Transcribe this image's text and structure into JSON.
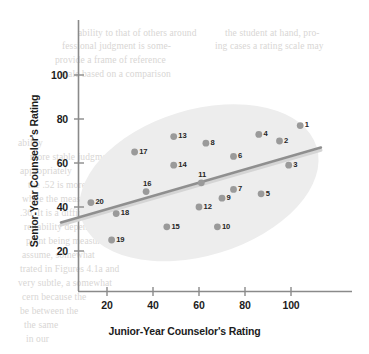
{
  "chart_data": {
    "type": "scatter",
    "title": "",
    "xlabel": "Junior-Year Counselor's Rating",
    "ylabel": "Senior-Year Counselor's Rating",
    "xlim": [
      0,
      118
    ],
    "ylim": [
      8,
      112
    ],
    "xticks": [
      20,
      40,
      60,
      80,
      100
    ],
    "yticks": [
      20,
      40,
      60,
      80,
      100
    ],
    "grid": false,
    "legend": null,
    "point_color": "#9a9a9a",
    "label_color": "#262626",
    "ellipse_color": "#ededed",
    "regression_line_color": "#8f8f8f",
    "axis_color": "#8a8a8a",
    "points": [
      {
        "label": "1",
        "x": 104,
        "y": 77
      },
      {
        "label": "2",
        "x": 95,
        "y": 70
      },
      {
        "label": "3",
        "x": 99,
        "y": 59
      },
      {
        "label": "4",
        "x": 86,
        "y": 73
      },
      {
        "label": "5",
        "x": 87,
        "y": 46
      },
      {
        "label": "6",
        "x": 75,
        "y": 63
      },
      {
        "label": "7",
        "x": 75,
        "y": 48
      },
      {
        "label": "8",
        "x": 63,
        "y": 69
      },
      {
        "label": "9",
        "x": 70,
        "y": 44
      },
      {
        "label": "10",
        "x": 68,
        "y": 31
      },
      {
        "label": "11",
        "x": 61,
        "y": 51
      },
      {
        "label": "12",
        "x": 60,
        "y": 40
      },
      {
        "label": "13",
        "x": 49,
        "y": 72
      },
      {
        "label": "14",
        "x": 49,
        "y": 59
      },
      {
        "label": "15",
        "x": 46,
        "y": 31
      },
      {
        "label": "16",
        "x": 37,
        "y": 47
      },
      {
        "label": "17",
        "x": 32,
        "y": 65
      },
      {
        "label": "18",
        "x": 24,
        "y": 37
      },
      {
        "label": "19",
        "x": 22,
        "y": 25
      },
      {
        "label": "20",
        "x": 13,
        "y": 42
      }
    ],
    "regression_line": {
      "x_start": 0,
      "y_start": 33,
      "x_end": 113,
      "y_end": 67
    },
    "ellipse": {
      "center_x": 60,
      "center_y": 51,
      "angle_deg": -17
    },
    "annotations": []
  },
  "page_bleed": {
    "lines": [
      {
        "text": "ability to that of others around",
        "x": 78,
        "y": 28
      },
      {
        "text": "the student at hand, pro-",
        "x": 225,
        "y": 28
      },
      {
        "text": "fessional judgment is some-",
        "x": 62,
        "y": 41
      },
      {
        "text": "ing cases a rating scale may",
        "x": 215,
        "y": 41
      },
      {
        "text": "provide a frame of reference",
        "x": 55,
        "y": 55
      },
      {
        "text": "scale based on a comparison",
        "x": 60,
        "y": 69
      },
      {
        "text": "ability",
        "x": 18,
        "y": 138
      },
      {
        "text": "more stable judgment will",
        "x": 30,
        "y": 152
      },
      {
        "text": "appropriately",
        "x": 20,
        "y": 166
      },
      {
        "text": "the .52 is more typical",
        "x": 28,
        "y": 180
      },
      {
        "text": "while the measure",
        "x": 22,
        "y": 194
      },
      {
        "text": ".36. It is a difficult problem",
        "x": 20,
        "y": 208
      },
      {
        "text": "reliability depends on",
        "x": 24,
        "y": 222
      },
      {
        "text": "point being measured",
        "x": 26,
        "y": 236
      },
      {
        "text": "assume, somewhat",
        "x": 22,
        "y": 250
      },
      {
        "text": "trated in Figures 4.1a and",
        "x": 20,
        "y": 264
      },
      {
        "text": "very subtle, a somewhat",
        "x": 18,
        "y": 278
      },
      {
        "text": "cern because the",
        "x": 22,
        "y": 292
      },
      {
        "text": "be between the",
        "x": 20,
        "y": 306
      },
      {
        "text": "the same",
        "x": 24,
        "y": 320
      },
      {
        "text": "in our",
        "x": 26,
        "y": 334
      }
    ]
  }
}
